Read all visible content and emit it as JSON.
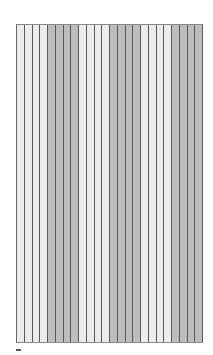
{
  "pattern": {
    "stripe_count": 24,
    "group_size": 4,
    "colors": {
      "light": "#ececec",
      "dark": "#bdbdbd",
      "separator": "#5a5a5a"
    },
    "stripes": [
      "light",
      "light",
      "light",
      "light",
      "dark",
      "dark",
      "dark",
      "dark",
      "light",
      "light",
      "light",
      "light",
      "dark",
      "dark",
      "dark",
      "dark",
      "light",
      "light",
      "light",
      "light",
      "dark",
      "dark",
      "dark",
      "dark"
    ]
  }
}
